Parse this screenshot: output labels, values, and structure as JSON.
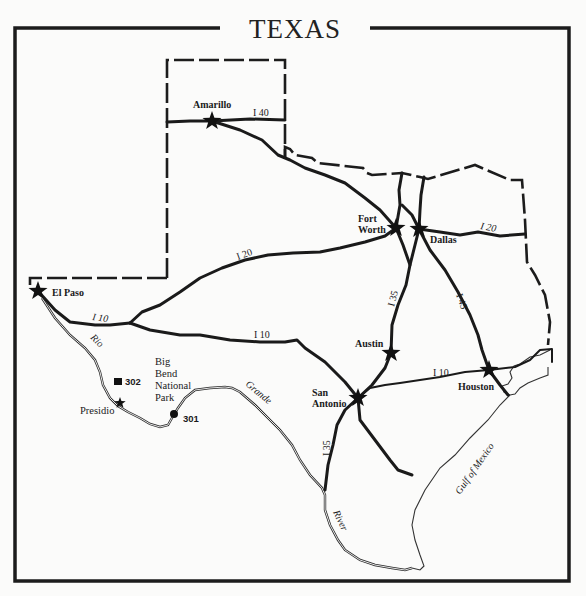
{
  "map": {
    "title": "TEXAS",
    "cities": [
      {
        "name": "Amarillo",
        "label": "Amarillo",
        "x": 212,
        "y": 121
      },
      {
        "name": "Fort Worth",
        "label_line1": "Fort",
        "label_line2": "Worth",
        "x": 396,
        "y": 228
      },
      {
        "name": "Dallas",
        "label": "Dallas",
        "x": 419,
        "y": 229
      },
      {
        "name": "El Paso",
        "label": "El Paso",
        "x": 38,
        "y": 291
      },
      {
        "name": "Austin",
        "label": "Austin",
        "x": 391,
        "y": 353
      },
      {
        "name": "San Antonio",
        "label_line1": "San",
        "label_line2": "Antonio",
        "x": 358,
        "y": 398
      },
      {
        "name": "Houston",
        "label": "Houston",
        "x": 489,
        "y": 370
      },
      {
        "name": "Presidio",
        "label": "Presidio",
        "x": 120,
        "y": 403
      }
    ],
    "highways": {
      "i40": "I 40",
      "i20_west": "I 20",
      "i20_east": "I 20",
      "i10_west": "I 10",
      "i10_central": "I 10",
      "i10_east": "I 10",
      "i35_north": "I 35",
      "i35_south": "I 35",
      "i45": "I 45"
    },
    "park": {
      "line1": "Big",
      "line2": "Bend",
      "line3": "National",
      "line4": "Park"
    },
    "markers": [
      {
        "id": "302",
        "label": "302",
        "shape": "square"
      },
      {
        "id": "301",
        "label": "301",
        "shape": "circle"
      }
    ],
    "water": {
      "rio": "Rio",
      "grande": "Grande",
      "river": "River",
      "gulf": "Gulf of Mexico"
    },
    "colors": {
      "ink": "#1a1a1a",
      "paper": "#fbfbfa"
    }
  }
}
